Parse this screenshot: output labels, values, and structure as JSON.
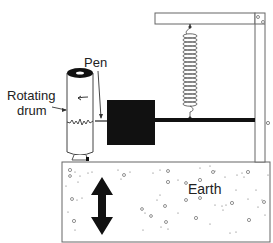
{
  "diagram": {
    "type": "seismograph",
    "labels": {
      "pen": "Pen",
      "drum_line1": "Rotating",
      "drum_line2": "drum",
      "earth": "Earth"
    },
    "components": [
      "frame",
      "spring",
      "mass",
      "rod",
      "pen",
      "rotating-drum",
      "earth-block",
      "vertical-motion-arrow"
    ],
    "colors": {
      "line": "#555555",
      "fill_dark": "#111111",
      "background": "#ffffff"
    }
  }
}
